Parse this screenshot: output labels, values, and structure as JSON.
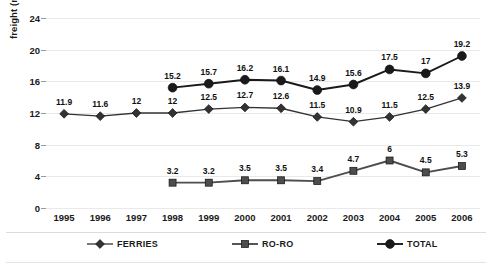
{
  "chart_data": {
    "type": "line",
    "title": "",
    "xlabel": "",
    "ylabel": "freight (million tons)",
    "ylim": [
      0,
      24
    ],
    "yticks": [
      0,
      4,
      8,
      12,
      16,
      20,
      24
    ],
    "grid": true,
    "legend_position": "bottom",
    "categories": [
      "1995",
      "1996",
      "1997",
      "1998",
      "1999",
      "2000",
      "2001",
      "2002",
      "2003",
      "2004",
      "2005",
      "2006"
    ],
    "series": [
      {
        "name": "FERRIES",
        "marker": "diamond",
        "color": "#333333",
        "values": [
          11.9,
          11.6,
          12,
          12,
          12.5,
          12.7,
          12.6,
          11.5,
          10.9,
          11.5,
          12.5,
          13.9
        ],
        "labels": [
          "11.9",
          "11.6",
          "12",
          "12",
          "12.5",
          "12.7",
          "12.6",
          "11.5",
          "10.9",
          "11.5",
          "12.5",
          "13.9"
        ]
      },
      {
        "name": "RO-RO",
        "marker": "square",
        "color": "#4d4d4d",
        "values": [
          null,
          null,
          null,
          3.2,
          3.2,
          3.5,
          3.5,
          3.4,
          4.7,
          6,
          4.5,
          5.3
        ],
        "labels": [
          "",
          "",
          "",
          "3.2",
          "3.2",
          "3.5",
          "3.5",
          "3.4",
          "4.7",
          "6",
          "4.5",
          "5.3"
        ]
      },
      {
        "name": "TOTAL",
        "marker": "circle",
        "color": "#1a1a1a",
        "values": [
          null,
          null,
          null,
          15.2,
          15.7,
          16.2,
          16.1,
          14.9,
          15.6,
          17.5,
          17,
          19.2
        ],
        "labels": [
          "",
          "",
          "",
          "15.2",
          "15.7",
          "16.2",
          "16.1",
          "14.9",
          "15.6",
          "17.5",
          "17",
          "19.2"
        ]
      }
    ]
  }
}
